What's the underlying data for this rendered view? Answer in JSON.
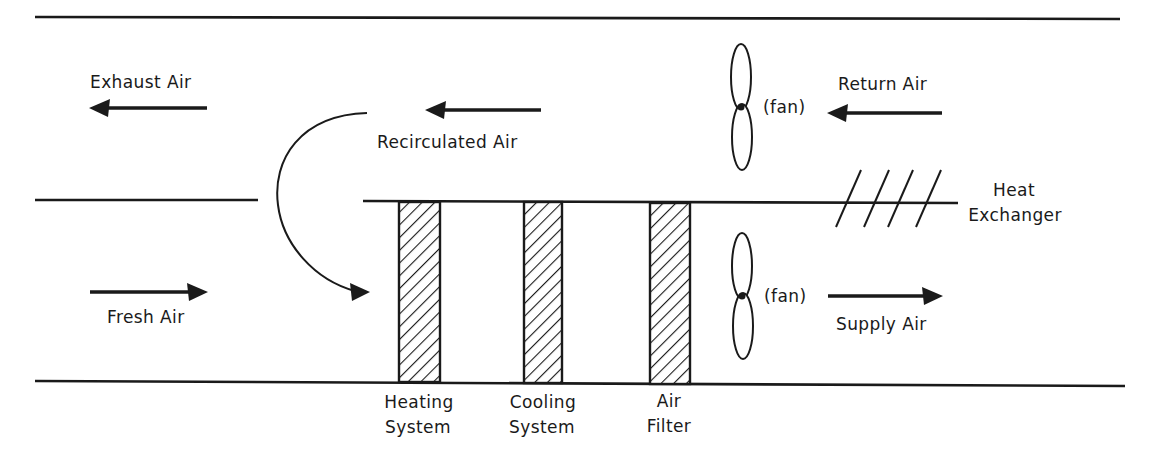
{
  "diagram": {
    "flows": {
      "exhaust_air": "Exhaust Air",
      "recirculated_air": "Recirculated Air",
      "return_air": "Return Air",
      "fresh_air": "Fresh Air",
      "supply_air": "Supply Air"
    },
    "fans": {
      "upper_fan_label": "(fan)",
      "lower_fan_label": "(fan)"
    },
    "components": [
      {
        "id": "heating",
        "line1": "Heating",
        "line2": "System"
      },
      {
        "id": "cooling",
        "line1": "Cooling",
        "line2": "System"
      },
      {
        "id": "filter",
        "line1": "Air",
        "line2": "Filter"
      }
    ],
    "heat_exchanger": {
      "line1": "Heat",
      "line2": "Exchanger"
    },
    "colors": {
      "ink": "#1a1a1a",
      "background": "#ffffff"
    }
  }
}
